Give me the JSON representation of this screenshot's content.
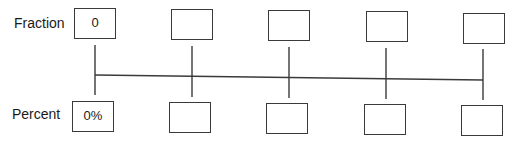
{
  "labels": {
    "fraction": "Fraction",
    "percent": "Percent"
  },
  "fraction_boxes": [
    "0",
    "",
    "",
    "",
    ""
  ],
  "percent_boxes": [
    "0%",
    "",
    "",
    "",
    ""
  ],
  "number_line": {
    "ticks": 5
  }
}
